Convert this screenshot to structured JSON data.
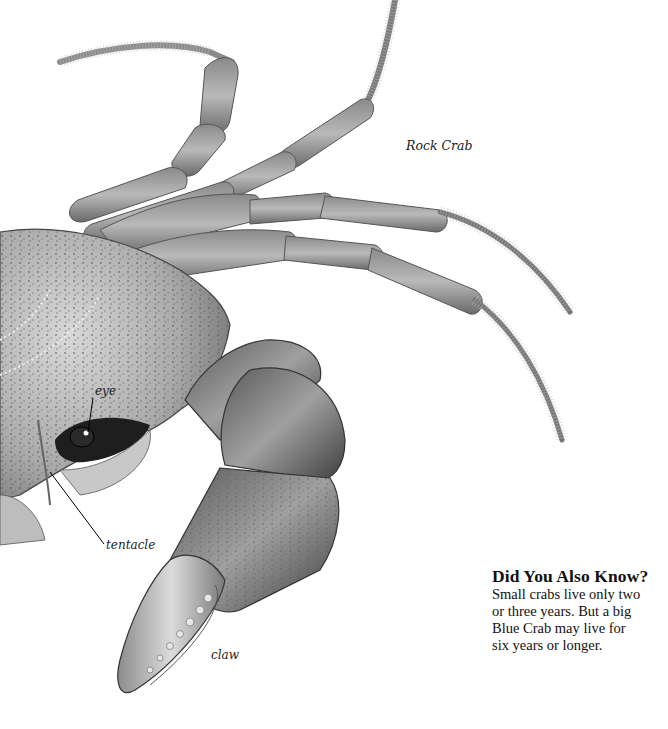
{
  "illustration": {
    "subject": "Rock Crab",
    "style": "grayscale stippled drawing"
  },
  "labels": {
    "species": "Rock Crab",
    "eye": "eye",
    "tentacle": "tentacle",
    "claw": "claw"
  },
  "fact_box": {
    "title": "Did You Also Know?",
    "lines": [
      "Small crabs live only two",
      "or three years. But a big",
      "Blue Crab may live for",
      "six years or longer."
    ]
  }
}
